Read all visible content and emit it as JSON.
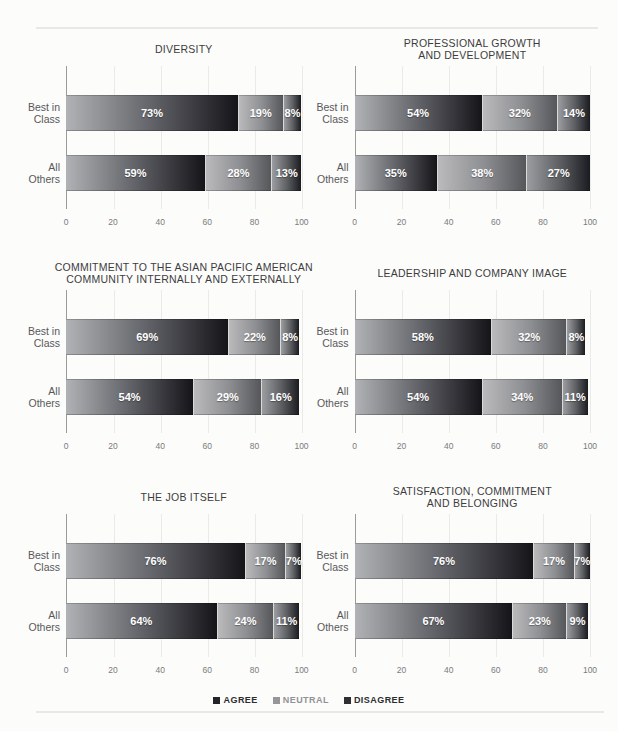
{
  "page": {
    "background": "#fcfcfb",
    "divider_color": "#e8e8e4"
  },
  "axis": {
    "line_color": "#9b9b99",
    "grid_color": "#eaeae6",
    "tick_color": "#7b7b7d"
  },
  "series_styles": {
    "Agree": {
      "from": "#b1b2b5",
      "mid": "#5f6065",
      "to": "#141419"
    },
    "Neutral": {
      "from": "#bababc",
      "mid": "#8e8f92",
      "to": "#56575b"
    },
    "Disagree": {
      "from": "#9c9da0",
      "mid": "#5e5f63",
      "to": "#1b1c21"
    }
  },
  "legend": {
    "items": [
      {
        "name": "agree",
        "label": "AGREE",
        "swatch": "#232328",
        "text_color": "#2c2c2e"
      },
      {
        "name": "neutral",
        "label": "NEUTRAL",
        "swatch": "#97979b",
        "text_color": "#929296"
      },
      {
        "name": "disagree",
        "label": "DISAGREE",
        "swatch": "#2e2e33",
        "text_color": "#2c2c2e"
      }
    ]
  },
  "chart_data": [
    {
      "type": "bar",
      "orientation": "horizontal",
      "title": "DIVERSITY",
      "categories": [
        "Best in\nClass",
        "All\nOthers"
      ],
      "series": [
        {
          "name": "Agree",
          "values": [
            73,
            59
          ]
        },
        {
          "name": "Neutral",
          "values": [
            19,
            28
          ]
        },
        {
          "name": "Disagree",
          "values": [
            8,
            13
          ]
        }
      ],
      "xlim": [
        0,
        100
      ],
      "xticks": [
        0,
        20,
        40,
        60,
        80,
        100
      ],
      "grid": true
    },
    {
      "type": "bar",
      "orientation": "horizontal",
      "title": "PROFESSIONAL GROWTH\nAND DEVELOPMENT",
      "categories": [
        "Best in\nClass",
        "All\nOthers"
      ],
      "series": [
        {
          "name": "Agree",
          "values": [
            54,
            35
          ]
        },
        {
          "name": "Neutral",
          "values": [
            32,
            38
          ]
        },
        {
          "name": "Disagree",
          "values": [
            14,
            27
          ]
        }
      ],
      "xlim": [
        0,
        100
      ],
      "xticks": [
        0,
        20,
        40,
        60,
        80,
        100
      ],
      "grid": true
    },
    {
      "type": "bar",
      "orientation": "horizontal",
      "title": "COMMITMENT TO THE ASIAN PACIFIC AMERICAN\nCOMMUNITY INTERNALLY AND EXTERNALLY",
      "categories": [
        "Best in\nClass",
        "All\nOthers"
      ],
      "series": [
        {
          "name": "Agree",
          "values": [
            69,
            54
          ]
        },
        {
          "name": "Neutral",
          "values": [
            22,
            29
          ]
        },
        {
          "name": "Disagree",
          "values": [
            8,
            16
          ]
        }
      ],
      "xlim": [
        0,
        100
      ],
      "xticks": [
        0,
        20,
        40,
        60,
        80,
        100
      ],
      "grid": true
    },
    {
      "type": "bar",
      "orientation": "horizontal",
      "title": "LEADERSHIP AND COMPANY IMAGE",
      "categories": [
        "Best in\nClass",
        "All\nOthers"
      ],
      "series": [
        {
          "name": "Agree",
          "values": [
            58,
            54
          ]
        },
        {
          "name": "Neutral",
          "values": [
            32,
            34
          ]
        },
        {
          "name": "Disagree",
          "values": [
            8,
            11
          ]
        }
      ],
      "xlim": [
        0,
        100
      ],
      "xticks": [
        0,
        20,
        40,
        60,
        80,
        100
      ],
      "grid": true
    },
    {
      "type": "bar",
      "orientation": "horizontal",
      "title": "THE JOB ITSELF",
      "categories": [
        "Best in\nClass",
        "All\nOthers"
      ],
      "series": [
        {
          "name": "Agree",
          "values": [
            76,
            64
          ]
        },
        {
          "name": "Neutral",
          "values": [
            17,
            24
          ]
        },
        {
          "name": "Disagree",
          "values": [
            7,
            11
          ]
        }
      ],
      "xlim": [
        0,
        100
      ],
      "xticks": [
        0,
        20,
        40,
        60,
        80,
        100
      ],
      "grid": true
    },
    {
      "type": "bar",
      "orientation": "horizontal",
      "title": "SATISFACTION, COMMITMENT\nAND BELONGING",
      "categories": [
        "Best in\nClass",
        "All\nOthers"
      ],
      "series": [
        {
          "name": "Agree",
          "values": [
            76,
            67
          ]
        },
        {
          "name": "Neutral",
          "values": [
            17,
            23
          ]
        },
        {
          "name": "Disagree",
          "values": [
            7,
            9
          ]
        }
      ],
      "xlim": [
        0,
        100
      ],
      "xticks": [
        0,
        20,
        40,
        60,
        80,
        100
      ],
      "grid": true
    }
  ]
}
